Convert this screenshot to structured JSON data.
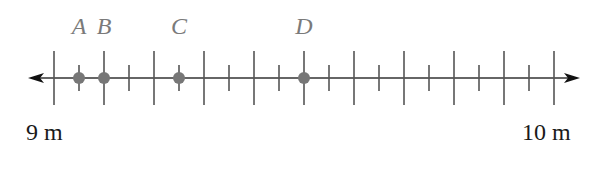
{
  "diagram": {
    "type": "number_line",
    "start": {
      "value": 9,
      "label": "9 m"
    },
    "end": {
      "value": 10,
      "label": "10 m"
    },
    "major_step": 0.1,
    "minor_step": 0.05,
    "points": [
      {
        "name": "A",
        "value": 9.05
      },
      {
        "name": "B",
        "value": 9.1
      },
      {
        "name": "C",
        "value": 9.25
      },
      {
        "name": "D",
        "value": 9.5
      }
    ],
    "colors": {
      "axis": "#333333",
      "tick": "#555555",
      "point": "#777777",
      "point_label": "#7a7a7a",
      "end_label": "#1a1a1a"
    }
  }
}
